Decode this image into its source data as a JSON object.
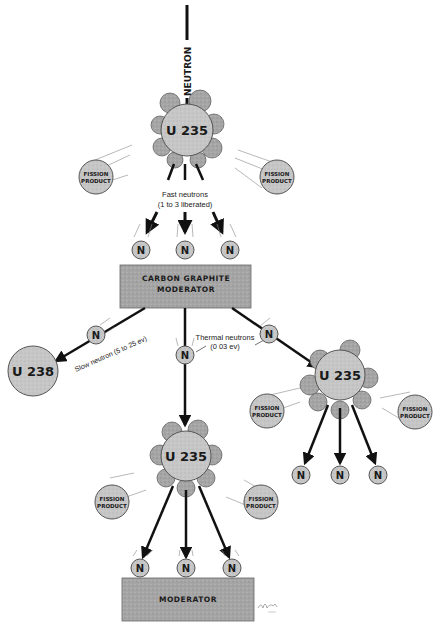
{
  "diagram": {
    "type": "nuclear-fission-chain-reaction",
    "colors": {
      "background": "#ffffff",
      "sphere_fill": "#c9c9c9",
      "moderator_fill": "#a8a8a8",
      "cloud_fill": "#b5b5b5",
      "ink": "#111111"
    },
    "incoming": {
      "label": "NEUTRON"
    },
    "top_nucleus": {
      "label": "U 235"
    },
    "top_fission_products": [
      {
        "label_line1": "FISSION",
        "label_line2": "PRODUCT"
      },
      {
        "label_line1": "FISSION",
        "label_line2": "PRODUCT"
      }
    ],
    "fast_neutrons": {
      "caption_line1": "Fast  neutrons",
      "caption_line2": "(1 to 3  liberated)",
      "neutrons": [
        "N",
        "N",
        "N"
      ]
    },
    "moderator_1": {
      "line1": "CARBON  GRAPHITE",
      "line2": "MODERATOR"
    },
    "slow_neutron": {
      "neutron": "N",
      "caption": "Slow  neutron  (5 to 25 ev)",
      "target": "U 238"
    },
    "thermal_neutrons": {
      "caption_line1": "Thermal  neutrons",
      "caption_line2": "(0 03  ev)",
      "neutron_left": "N",
      "neutron_right": "N"
    },
    "right_nucleus": {
      "label": "U 235",
      "fission_products": [
        {
          "label_line1": "FISSION",
          "label_line2": "PRODUCT"
        },
        {
          "label_line1": "FISSION",
          "label_line2": "PRODUCT"
        }
      ],
      "neutrons": [
        "N",
        "N",
        "N"
      ]
    },
    "bottom_nucleus": {
      "label": "U 235",
      "fission_products": [
        {
          "label_line1": "FISSION",
          "label_line2": "PRODUCT"
        },
        {
          "label_line1": "FISSION",
          "label_line2": "PRODUCT"
        }
      ],
      "neutrons": [
        "N",
        "N",
        "N"
      ]
    },
    "moderator_2": {
      "line1": "MODERATOR"
    }
  }
}
